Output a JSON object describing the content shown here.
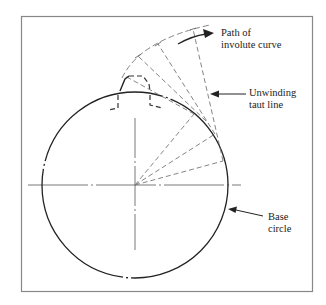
{
  "figure": {
    "colors": {
      "line": "#333333",
      "dash": "#777777",
      "frame": "#888888",
      "background": "#ffffff"
    },
    "frame": {
      "x": 21,
      "y": 16,
      "width": 292,
      "height": 276
    },
    "base_circle": {
      "cx": 135,
      "cy": 185,
      "r": 93
    },
    "labels": {
      "path": {
        "line1": "Path of",
        "line2": "involute curve"
      },
      "taut": {
        "line1": "Unwinding",
        "line2": "taut line"
      },
      "base": {
        "line1": "Base",
        "line2": "circle"
      }
    }
  }
}
